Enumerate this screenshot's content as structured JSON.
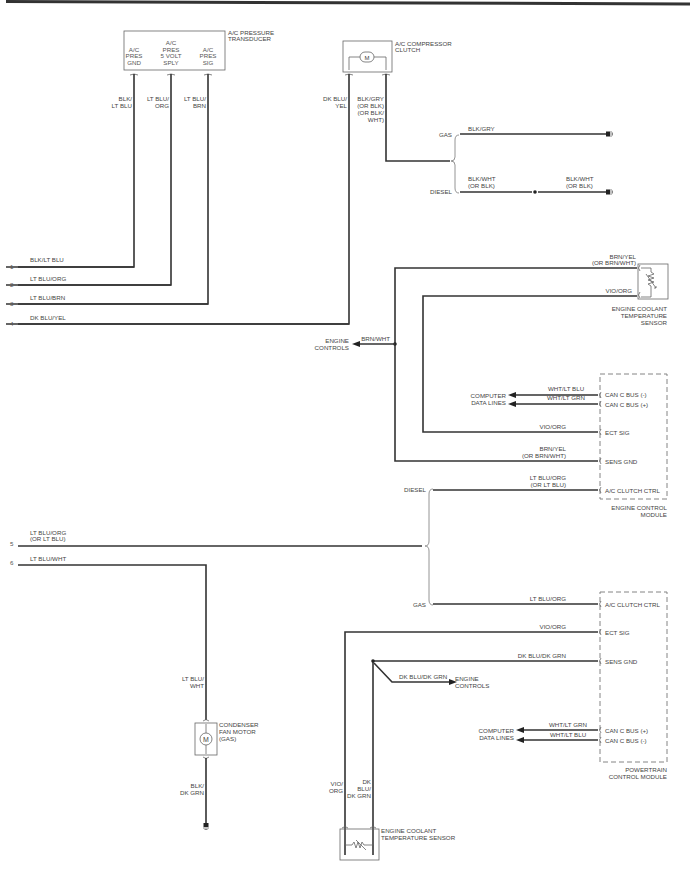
{
  "components": {
    "pressure_transducer": {
      "title_1": "A/C PRESSURE",
      "title_2": "TRANSDUCER",
      "pins": [
        {
          "l1": "",
          "l2": "A/C",
          "l3": "PRES",
          "l4": "GND"
        },
        {
          "l1": "A/C",
          "l2": "PRES",
          "l3": "5 VOLT",
          "l4": "SPLY"
        },
        {
          "l1": "",
          "l2": "A/C",
          "l3": "PRES",
          "l4": "SIG"
        }
      ]
    },
    "compressor_clutch": {
      "title_1": "A/C COMPRESSOR",
      "title_2": "CLUTCH",
      "symbol": "M"
    },
    "ect_sensor_top": {
      "title_1": "ENGINE COOLANT",
      "title_2": "TEMPERATURE",
      "title_3": "SENSOR"
    },
    "ecm": {
      "title_1": "ENGINE CONTROL",
      "title_2": "MODULE",
      "pins": [
        "CAN C BUS (-)",
        "CAN C BUS (+)",
        "ECT SIG",
        "SENS GND",
        "A/C CLUTCH CTRL"
      ]
    },
    "pcm": {
      "title_1": "POWERTRAIN",
      "title_2": "CONTROL MODULE",
      "pins": [
        "A/C CLUTCH CTRL",
        "ECT SIG",
        "SENS GND",
        "CAN C BUS (+)",
        "CAN C BUS (-)"
      ]
    },
    "condenser_fan": {
      "title_1": "CONDENSER",
      "title_2": "FAN MOTOR",
      "title_3": "(GAS)",
      "symbol": "M"
    },
    "ect_sensor_bottom": {
      "title_1": "ENGINE COOLANT",
      "title_2": "TEMPERATURE SENSOR"
    }
  },
  "wires": {
    "transducer_gnd": {
      "l1": "BLK/",
      "l2": "LT BLU"
    },
    "transducer_5v": {
      "l1": "LT BLU/",
      "l2": "ORG"
    },
    "transducer_sig": {
      "l1": "LT BLU/",
      "l2": "BRN"
    },
    "clutch_feed": {
      "l1": "DK BLU/",
      "l2": "YEL"
    },
    "clutch_gnd": {
      "l1": "BLK/GRY",
      "l2": "(OR BLK)",
      "l3": "(OR BLK/",
      "l4": "WHT)"
    },
    "gas_gnd": "BLK/GRY",
    "diesel_gnd_a": {
      "l1": "BLK/WHT",
      "l2": "(OR BLK)"
    },
    "diesel_gnd_b": {
      "l1": "BLK/WHT",
      "l2": "(OR BLK)"
    },
    "ect_top_gnd": {
      "l1": "BRN/YEL",
      "l2": "(OR BRN/WHT)"
    },
    "ect_top_sig": "VIO/ORG",
    "engine_controls_top": "BRN/WHT",
    "ecm_can_minus": "WHT/LT BLU",
    "ecm_can_plus": "WHT/LT GRN",
    "ecm_ect_sig": "VIO/ORG",
    "ecm_sens_gnd": {
      "l1": "BRN/YEL",
      "l2": "(OR BRN/WHT)"
    },
    "ecm_clutch": {
      "l1": "LT BLU/ORG",
      "l2": "(OR LT BLU)"
    },
    "pcm_clutch": "LT BLU/ORG",
    "pcm_ect_sig": "VIO/ORG",
    "pcm_sens_gnd": "DK BLU/DK GRN",
    "engine_controls_bottom": "DK BLU/DK GRN",
    "pcm_can_plus": "WHT/LT GRN",
    "pcm_can_minus": "WHT/LT BLU",
    "fan_feed": {
      "l1": "LT BLU/",
      "l2": "WHT"
    },
    "fan_gnd": {
      "l1": "BLK/",
      "l2": "DK GRN"
    },
    "ect_bot_sig": {
      "l1": "VIO/",
      "l2": "ORG"
    },
    "ect_bot_gnd": {
      "l1": "DK",
      "l2": "BLU/",
      "l3": "DK GRN"
    }
  },
  "connector_pins": [
    {
      "num": "1",
      "wire": "BLK/LT BLU"
    },
    {
      "num": "2",
      "wire": "LT BLU/ORG"
    },
    {
      "num": "3",
      "wire": "LT BLU/BRN"
    },
    {
      "num": "4",
      "wire": "DK BLU/YEL"
    },
    {
      "num": "5",
      "wire": "LT BLU/ORG",
      "wire2": "(OR LT BLU)"
    },
    {
      "num": "6",
      "wire": "LT BLU/WHT"
    }
  ],
  "variants": {
    "gas": "GAS",
    "diesel": "DIESEL"
  },
  "destinations": {
    "engine_controls_1": "ENGINE",
    "engine_controls_2": "CONTROLS",
    "data_lines_1": "COMPUTER",
    "data_lines_2": "DATA LINES"
  }
}
